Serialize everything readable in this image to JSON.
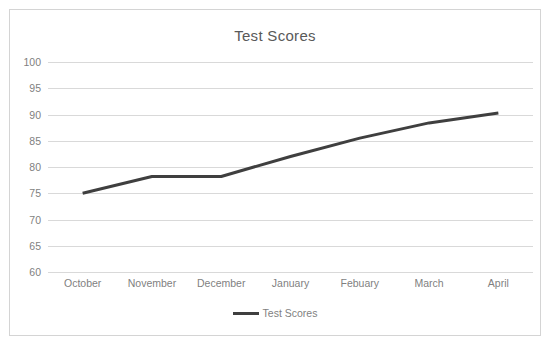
{
  "chart_data": {
    "type": "line",
    "title": "Test Scores",
    "xlabel": "",
    "ylabel": "",
    "categories": [
      "October",
      "November",
      "December",
      "January",
      "Febuary",
      "March",
      "April"
    ],
    "series": [
      {
        "name": "Test Scores",
        "values": [
          75,
          78.2,
          78.2,
          82,
          85.5,
          88.4,
          90.3
        ],
        "color": "#3f3f3f"
      }
    ],
    "ylim": [
      60,
      100
    ],
    "yticks": [
      100,
      95,
      90,
      85,
      80,
      75,
      70,
      65,
      60
    ],
    "grid": true,
    "legend": {
      "position": "bottom",
      "entries": [
        "Test Scores"
      ]
    }
  },
  "style": {
    "line_color": "#3f3f3f",
    "grid_color": "#d9d9d9",
    "text_color": "#7f7f7f",
    "title_color": "#595959",
    "border_color": "#d4d4d4",
    "background": "#ffffff"
  }
}
